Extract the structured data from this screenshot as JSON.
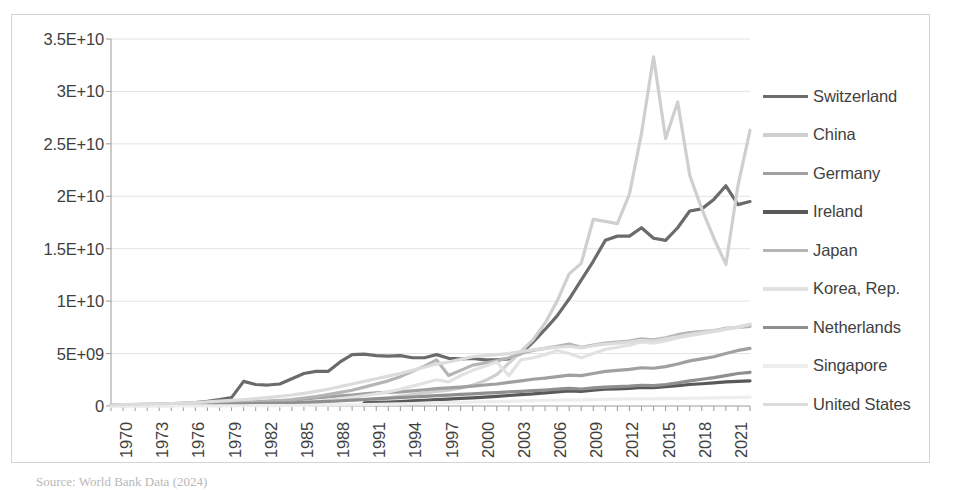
{
  "chart_data": {
    "type": "line",
    "title": "",
    "xlabel": "",
    "ylabel": "",
    "xlim": [
      1970,
      2023
    ],
    "ylim": [
      0,
      35000000000
    ],
    "grid": true,
    "legend_position": "right",
    "y_ticks": [
      {
        "value": 0,
        "label": "0"
      },
      {
        "value": 5000000000,
        "label": "5E+09"
      },
      {
        "value": 10000000000,
        "label": "1E+10"
      },
      {
        "value": 15000000000,
        "label": "1.5E+10"
      },
      {
        "value": 20000000000,
        "label": "2E+10"
      },
      {
        "value": 25000000000,
        "label": "2.5E+10"
      },
      {
        "value": 30000000000,
        "label": "3E+10"
      },
      {
        "value": 35000000000,
        "label": "3.5E+10"
      }
    ],
    "x_tick_labels": [
      "1970",
      "1973",
      "1976",
      "1979",
      "1982",
      "1985",
      "1988",
      "1991",
      "1994",
      "1997",
      "2000",
      "2003",
      "2006",
      "2009",
      "2012",
      "2015",
      "2018",
      "2021"
    ],
    "x": [
      1970,
      1971,
      1972,
      1973,
      1974,
      1975,
      1976,
      1977,
      1978,
      1979,
      1980,
      1981,
      1982,
      1983,
      1984,
      1985,
      1986,
      1987,
      1988,
      1989,
      1990,
      1991,
      1992,
      1993,
      1994,
      1995,
      1996,
      1997,
      1998,
      1999,
      2000,
      2001,
      2002,
      2003,
      2004,
      2005,
      2006,
      2007,
      2008,
      2009,
      2010,
      2011,
      2012,
      2013,
      2014,
      2015,
      2016,
      2017,
      2018,
      2019,
      2020,
      2021,
      2022,
      2023
    ],
    "series": [
      {
        "name": "Switzerland",
        "color": "#6b6b6b",
        "width": 3.2,
        "values": [
          100000000.0,
          110000000.0,
          130000000.0,
          160000000.0,
          190000000.0,
          220000000.0,
          260000000.0,
          320000000.0,
          440000000.0,
          620000000.0,
          800000000.0,
          2350000000.0,
          2050000000.0,
          2000000000.0,
          2100000000.0,
          2600000000.0,
          3100000000.0,
          3300000000.0,
          3300000000.0,
          4200000000.0,
          4900000000.0,
          4950000000.0,
          4800000000.0,
          4750000000.0,
          4800000000.0,
          4600000000.0,
          4600000000.0,
          4900000000.0,
          4550000000.0,
          4500000000.0,
          4550000000.0,
          4400000000.0,
          4400000000.0,
          4500000000.0,
          5000000000.0,
          6100000000.0,
          7300000000.0,
          8600000000.0,
          10200000000.0,
          12000000000.0,
          13800000000.0,
          15800000000.0,
          16200000000.0,
          16200000000.0,
          17000000000.0,
          16000000000.0,
          15800000000.0,
          17000000000.0,
          18600000000.0,
          18800000000.0,
          19700000000.0,
          21000000000.0,
          19200000000.0,
          19500000000.0
        ]
      },
      {
        "name": "China",
        "color": "#cfcfcf",
        "width": 3.2,
        "values": [
          30000000.0,
          32000000.0,
          35000000.0,
          40000000.0,
          45000000.0,
          50000000.0,
          55000000.0,
          65000000.0,
          80000000.0,
          100000000.0,
          130000000.0,
          160000000.0,
          190000000.0,
          220000000.0,
          260000000.0,
          300000000.0,
          340000000.0,
          390000000.0,
          450000000.0,
          500000000.0,
          550000000.0,
          600000000.0,
          700000000.0,
          800000000.0,
          950000000.0,
          1100000000.0,
          1250000000.0,
          1400000000.0,
          1500000000.0,
          1700000000.0,
          2000000000.0,
          2400000000.0,
          3000000000.0,
          4100000000.0,
          5200000000.0,
          6300000000.0,
          7900000000.0,
          10000000000.0,
          12600000000.0,
          13600000000.0,
          17800000000.0,
          17600000000.0,
          17400000000.0,
          20200000000.0,
          26000000000.0,
          33300000000.0,
          25500000000.0,
          29000000000.0,
          22000000000.0,
          18800000000.0,
          16000000000.0,
          13500000000.0,
          21000000000.0,
          26300000000.0
        ]
      },
      {
        "name": "Germany",
        "color": "#a0a0a0",
        "width": 3.2,
        "values": [
          70000000.0,
          75000000.0,
          85000000.0,
          100000000.0,
          120000000.0,
          140000000.0,
          160000000.0,
          190000000.0,
          230000000.0,
          270000000.0,
          320000000.0,
          360000000.0,
          400000000.0,
          440000000.0,
          490000000.0,
          550000000.0,
          650000000.0,
          760000000.0,
          860000000.0,
          960000000.0,
          1050000000.0,
          1150000000.0,
          1250000000.0,
          1300000000.0,
          1350000000.0,
          1450000000.0,
          1550000000.0,
          1650000000.0,
          1720000000.0,
          1800000000.0,
          1900000000.0,
          2000000000.0,
          2100000000.0,
          2250000000.0,
          2400000000.0,
          2550000000.0,
          2650000000.0,
          2800000000.0,
          2950000000.0,
          2900000000.0,
          3100000000.0,
          3300000000.0,
          3400000000.0,
          3500000000.0,
          3650000000.0,
          3600000000.0,
          3750000000.0,
          4000000000.0,
          4300000000.0,
          4500000000.0,
          4700000000.0,
          5000000000.0,
          5300000000.0,
          5500000000.0
        ]
      },
      {
        "name": "Ireland",
        "color": "#595959",
        "width": 3.2,
        "values": [
          null,
          null,
          null,
          null,
          null,
          null,
          null,
          null,
          null,
          null,
          null,
          null,
          null,
          null,
          null,
          null,
          null,
          null,
          null,
          null,
          null,
          300000000.0,
          340000000.0,
          380000000.0,
          420000000.0,
          480000000.0,
          540000000.0,
          600000000.0,
          660000000.0,
          720000000.0,
          780000000.0,
          850000000.0,
          920000000.0,
          1000000000.0,
          1080000000.0,
          1150000000.0,
          1250000000.0,
          1350000000.0,
          1450000000.0,
          1400000000.0,
          1500000000.0,
          1600000000.0,
          1620000000.0,
          1680000000.0,
          1780000000.0,
          1750000000.0,
          1850000000.0,
          1950000000.0,
          2050000000.0,
          2120000000.0,
          2200000000.0,
          2300000000.0,
          2350000000.0,
          2400000000.0
        ]
      },
      {
        "name": "Japan",
        "color": "#b5b5b5",
        "width": 3.2,
        "values": [
          50000000.0,
          55000000.0,
          65000000.0,
          80000000.0,
          95000000.0,
          110000000.0,
          130000000.0,
          160000000.0,
          200000000.0,
          240000000.0,
          280000000.0,
          330000000.0,
          380000000.0,
          440000000.0,
          520000000.0,
          600000000.0,
          750000000.0,
          900000000.0,
          1100000000.0,
          1300000000.0,
          1500000000.0,
          1800000000.0,
          2100000000.0,
          2400000000.0,
          2800000000.0,
          3300000000.0,
          3800000000.0,
          4400000000.0,
          2900000000.0,
          3400000000.0,
          3900000000.0,
          4100000000.0,
          4300000000.0,
          4600000000.0,
          5000000000.0,
          5300000000.0,
          5500000000.0,
          5700000000.0,
          5900000000.0,
          5600000000.0,
          5800000000.0,
          6000000000.0,
          6100000000.0,
          6200000000.0,
          6400000000.0,
          6300000000.0,
          6500000000.0,
          6800000000.0,
          7000000000.0,
          7100000000.0,
          7200000000.0,
          7400000000.0,
          7500000000.0,
          7600000000.0
        ]
      },
      {
        "name": "Korea, Rep.",
        "color": "#e2e2e2",
        "width": 3.2,
        "values": [
          20000000.0,
          22000000.0,
          25000000.0,
          30000000.0,
          35000000.0,
          40000000.0,
          48000000.0,
          60000000.0,
          75000000.0,
          90000000.0,
          110000000.0,
          130000000.0,
          160000000.0,
          190000000.0,
          230000000.0,
          280000000.0,
          350000000.0,
          440000000.0,
          550000000.0,
          680000000.0,
          820000000.0,
          980000000.0,
          1150000000.0,
          1350000000.0,
          1600000000.0,
          1900000000.0,
          2200000000.0,
          2500000000.0,
          2300000000.0,
          2900000000.0,
          3400000000.0,
          3800000000.0,
          4200000000.0,
          2900000000.0,
          4400000000.0,
          4600000000.0,
          4900000000.0,
          5300000000.0,
          5000000000.0,
          4600000000.0,
          5000000000.0,
          5400000000.0,
          5600000000.0,
          5800000000.0,
          6100000000.0,
          6000000000.0,
          6200000000.0,
          6500000000.0,
          6700000000.0,
          6900000000.0,
          7100000000.0,
          7300000000.0,
          7500000000.0,
          7800000000.0
        ]
      },
      {
        "name": "Netherlands",
        "color": "#8f8f8f",
        "width": 3.2,
        "values": [
          60000000.0,
          65000000.0,
          70000000.0,
          80000000.0,
          90000000.0,
          100000000.0,
          115000000.0,
          130000000.0,
          150000000.0,
          170000000.0,
          190000000.0,
          210000000.0,
          230000000.0,
          250000000.0,
          280000000.0,
          310000000.0,
          350000000.0,
          400000000.0,
          450000000.0,
          500000000.0,
          560000000.0,
          620000000.0,
          680000000.0,
          740000000.0,
          800000000.0,
          860000000.0,
          920000000.0,
          980000000.0,
          1040000000.0,
          1100000000.0,
          1160000000.0,
          1220000000.0,
          1280000000.0,
          1340000000.0,
          1400000000.0,
          1460000000.0,
          1520000000.0,
          1600000000.0,
          1680000000.0,
          1620000000.0,
          1720000000.0,
          1800000000.0,
          1850000000.0,
          1900000000.0,
          1980000000.0,
          1950000000.0,
          2050000000.0,
          2200000000.0,
          2400000000.0,
          2550000000.0,
          2700000000.0,
          2900000000.0,
          3100000000.0,
          3200000000.0
        ]
      },
      {
        "name": "Singapore",
        "color": "#ededed",
        "width": 3.2,
        "values": [
          5000000.0,
          5500000.0,
          6000000.0,
          7000000.0,
          8000000.0,
          9000000.0,
          10000000.0,
          12000000.0,
          14000000.0,
          17000000.0,
          20000000.0,
          24000000.0,
          29000000.0,
          35000000.0,
          42000000.0,
          50000000.0,
          60000000.0,
          72000000.0,
          86000000.0,
          100000000.0,
          120000000.0,
          140000000.0,
          160000000.0,
          185000000.0,
          210000000.0,
          240000000.0,
          270000000.0,
          300000000.0,
          320000000.0,
          350000000.0,
          380000000.0,
          400000000.0,
          420000000.0,
          450000000.0,
          480000000.0,
          500000000.0,
          530000000.0,
          560000000.0,
          590000000.0,
          570000000.0,
          600000000.0,
          630000000.0,
          650000000.0,
          670000000.0,
          690000000.0,
          680000000.0,
          700000000.0,
          720000000.0,
          740000000.0,
          760000000.0,
          780000000.0,
          800000000.0,
          820000000.0,
          840000000.0
        ]
      },
      {
        "name": "United States",
        "color": "#dcdcdc",
        "width": 3.2,
        "values": [
          120000000.0,
          130000000.0,
          150000000.0,
          180000000.0,
          210000000.0,
          240000000.0,
          280000000.0,
          330000000.0,
          390000000.0,
          460000000.0,
          540000000.0,
          620000000.0,
          700000000.0,
          800000000.0,
          920000000.0,
          1050000000.0,
          1200000000.0,
          1400000000.0,
          1600000000.0,
          1850000000.0,
          2100000000.0,
          2350000000.0,
          2600000000.0,
          2850000000.0,
          3100000000.0,
          3400000000.0,
          3700000000.0,
          4000000000.0,
          4200000000.0,
          4450000000.0,
          4700000000.0,
          4800000000.0,
          4900000000.0,
          5000000000.0,
          5200000000.0,
          5350000000.0,
          5500000000.0,
          5600000000.0,
          5700000000.0,
          5550000000.0,
          5750000000.0,
          5900000000.0,
          6000000000.0,
          6100000000.0,
          6250000000.0,
          6200000000.0,
          6400000000.0,
          6600000000.0,
          6800000000.0,
          7000000000.0,
          7150000000.0,
          7350000000.0,
          7550000000.0,
          7800000000.0
        ]
      }
    ]
  },
  "source_note": "Source: World Bank Data (2024)"
}
